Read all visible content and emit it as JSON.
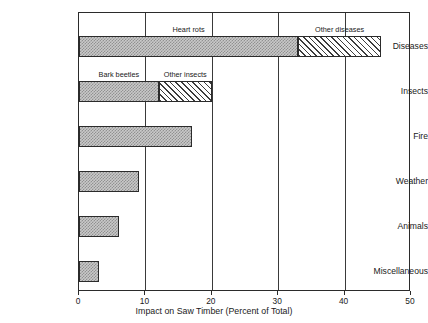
{
  "chart_data": {
    "type": "bar",
    "orientation": "horizontal",
    "title": "",
    "xlabel": "Impact on Saw Timber (Percent of Total)",
    "ylabel": "",
    "xlim": [
      0,
      50
    ],
    "xticks": [
      0,
      10,
      20,
      30,
      40,
      50
    ],
    "xtick_labels": [
      "0",
      "10",
      "20",
      "30",
      "40",
      "50"
    ],
    "grid": true,
    "grid_axis": "x",
    "legend": "none",
    "categories": [
      "Diseases",
      "Insects",
      "Fire",
      "Weather",
      "Animals",
      "Miscellaneous"
    ],
    "values": [
      45.5,
      20,
      17,
      9,
      6,
      3
    ],
    "stacked": true,
    "bars": [
      {
        "category": "Diseases",
        "total": 45.5,
        "segments": [
          {
            "label": "Heart rots",
            "start": 0,
            "end": 33,
            "value": 33,
            "fill": "stipple-gray"
          },
          {
            "label": "Other diseases",
            "start": 33,
            "end": 45.5,
            "value": 12.5,
            "fill": "diagonal-hatch"
          }
        ]
      },
      {
        "category": "Insects",
        "total": 20,
        "segments": [
          {
            "label": "Bark beetles",
            "start": 0,
            "end": 12,
            "value": 12,
            "fill": "stipple-gray"
          },
          {
            "label": "Other insects",
            "start": 12,
            "end": 20,
            "value": 8,
            "fill": "diagonal-hatch"
          }
        ]
      },
      {
        "category": "Fire",
        "total": 17,
        "segments": [
          {
            "label": "",
            "start": 0,
            "end": 17,
            "value": 17,
            "fill": "stipple-gray"
          }
        ]
      },
      {
        "category": "Weather",
        "total": 9,
        "segments": [
          {
            "label": "",
            "start": 0,
            "end": 9,
            "value": 9,
            "fill": "stipple-gray"
          }
        ]
      },
      {
        "category": "Animals",
        "total": 6,
        "segments": [
          {
            "label": "",
            "start": 0,
            "end": 6,
            "value": 6,
            "fill": "stipple-gray"
          }
        ]
      },
      {
        "category": "Miscellaneous",
        "total": 3,
        "segments": [
          {
            "label": "",
            "start": 0,
            "end": 3,
            "value": 3,
            "fill": "stipple-gray"
          }
        ]
      }
    ],
    "annotations": [
      {
        "text": "Heart rots",
        "bar": "Diseases",
        "at_x": 16.5
      },
      {
        "text": "Other diseases",
        "bar": "Diseases",
        "at_x": 39.25
      },
      {
        "text": "Bark beetles",
        "bar": "Insects",
        "at_x": 6
      },
      {
        "text": "Other insects",
        "bar": "Insects",
        "at_x": 16
      }
    ],
    "colors": {
      "frame": "#2b2b2b",
      "gridline": "#3a3a3a",
      "segment_fill_primary": "#c9c9c9",
      "segment_fill_secondary": "#ffffff",
      "hatch_stroke": "#3d3d3d",
      "text": "#1a1a1a",
      "background": "#ffffff"
    }
  }
}
